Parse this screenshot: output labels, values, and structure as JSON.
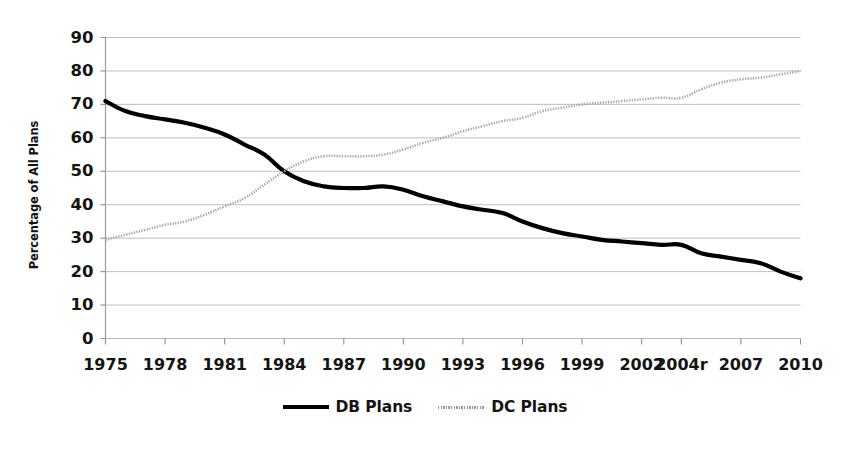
{
  "chart_data": {
    "type": "line",
    "title": "",
    "xlabel": "",
    "ylabel": "Percentage of All Plans",
    "ylim": [
      0,
      90
    ],
    "ytick_step": 10,
    "yticks": [
      "0",
      "10",
      "20",
      "30",
      "40",
      "50",
      "60",
      "70",
      "80",
      "90"
    ],
    "grid": true,
    "legend_position": "bottom-center",
    "x": [
      1975,
      1976,
      1977,
      1978,
      1979,
      1980,
      1981,
      1982,
      1983,
      1984,
      1985,
      1986,
      1987,
      1988,
      1989,
      1990,
      1991,
      1992,
      1993,
      1994,
      1995,
      1996,
      1997,
      1998,
      1999,
      2000,
      2001,
      2002,
      2003,
      2004,
      2005,
      2006,
      2007,
      2008,
      2009,
      2010
    ],
    "xtick_labels": [
      "1975",
      "1978",
      "1981",
      "1984",
      "1987",
      "1990",
      "1993",
      "1996",
      "1999",
      "2002",
      "2004r",
      "2007",
      "2010"
    ],
    "xtick_values": [
      1975,
      1978,
      1981,
      1984,
      1987,
      1990,
      1993,
      1996,
      1999,
      2002,
      2004,
      2007,
      2010
    ],
    "series": [
      {
        "name": "DB Plans",
        "color": "#000000",
        "style": "solid",
        "width": 4.2,
        "values": [
          71,
          68,
          66.5,
          65.5,
          64.5,
          63,
          61,
          58,
          55,
          50,
          47,
          45.5,
          45,
          45,
          45.5,
          44.5,
          42.5,
          41,
          39.5,
          38.5,
          37.5,
          35,
          33,
          31.5,
          30.5,
          29.5,
          29,
          28.5,
          28,
          28,
          25.5,
          24.5,
          23.5,
          22.5,
          20,
          18
        ]
      },
      {
        "name": "DC Plans",
        "color": "#a8a8a8",
        "style": "dotted",
        "width": 2.6,
        "values": [
          29.5,
          31,
          32.5,
          34,
          35,
          37,
          39.5,
          42,
          46,
          50,
          53,
          54.5,
          54.5,
          54.5,
          55,
          56.5,
          58.5,
          60,
          62,
          63.5,
          65,
          66,
          68,
          69,
          70,
          70.5,
          71,
          71.5,
          72,
          72,
          74.5,
          76.5,
          77.5,
          78,
          79,
          80
        ]
      }
    ]
  },
  "legend": {
    "items": [
      {
        "label": "DB Plans",
        "marker": "solid-line-swatch"
      },
      {
        "label": "DC Plans",
        "marker": "dotted-line-swatch"
      }
    ]
  }
}
